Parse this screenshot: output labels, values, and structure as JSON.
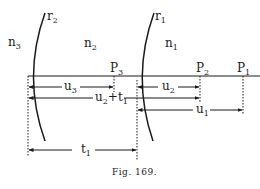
{
  "diagram": {
    "caption": "Fig. 169.",
    "surfaces": [
      {
        "id": "r2",
        "label": "r",
        "sub": "2"
      },
      {
        "id": "r1",
        "label": "r",
        "sub": "1"
      }
    ],
    "media": [
      {
        "id": "n3",
        "label": "n",
        "sub": "3"
      },
      {
        "id": "n2",
        "label": "n",
        "sub": "2"
      },
      {
        "id": "n1",
        "label": "n",
        "sub": "1"
      }
    ],
    "points": [
      {
        "id": "P3",
        "label": "P",
        "sub": "3"
      },
      {
        "id": "P2",
        "label": "P",
        "sub": "2"
      },
      {
        "id": "P1",
        "label": "P",
        "sub": "1"
      }
    ],
    "distances": [
      {
        "id": "u3",
        "label": "u",
        "sub": "3"
      },
      {
        "id": "u2",
        "label": "u",
        "sub": "2"
      },
      {
        "id": "u2t1",
        "label": "u",
        "sub": "2",
        "suffix": "+t",
        "suffix_sub": "1"
      },
      {
        "id": "u1",
        "label": "u",
        "sub": "1"
      },
      {
        "id": "t1",
        "label": "t",
        "sub": "1"
      }
    ],
    "colors": {
      "ink": "#1a1a1a",
      "background": "#ffffff"
    }
  }
}
